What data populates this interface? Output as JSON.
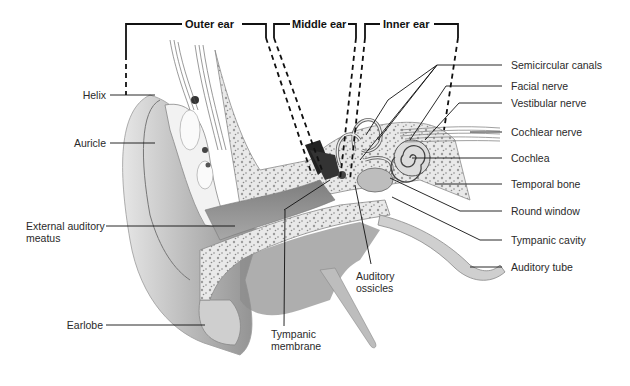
{
  "diagram": {
    "sections": [
      {
        "id": "outer",
        "label": "Outer ear"
      },
      {
        "id": "middle",
        "label": "Middle ear"
      },
      {
        "id": "inner",
        "label": "Inner ear"
      }
    ],
    "labels_left": [
      {
        "id": "helix",
        "text": "Helix"
      },
      {
        "id": "auricle",
        "text": "Auricle"
      },
      {
        "id": "external-auditory-meatus",
        "line1": "External auditory",
        "line2": "meatus"
      },
      {
        "id": "earlobe",
        "text": "Earlobe"
      }
    ],
    "labels_bottom": [
      {
        "id": "tympanic-membrane",
        "line1": "Tympanic",
        "line2": "membrane"
      },
      {
        "id": "auditory-ossicles",
        "line1": "Auditory",
        "line2": "ossicles"
      }
    ],
    "labels_right": [
      {
        "id": "semicircular-canals",
        "text": "Semicircular canals"
      },
      {
        "id": "facial-nerve",
        "text": "Facial nerve"
      },
      {
        "id": "vestibular-nerve",
        "text": "Vestibular nerve"
      },
      {
        "id": "cochlear-nerve",
        "text": "Cochlear nerve"
      },
      {
        "id": "cochlea",
        "text": "Cochlea"
      },
      {
        "id": "temporal-bone",
        "text": "Temporal bone"
      },
      {
        "id": "round-window",
        "text": "Round window"
      },
      {
        "id": "tympanic-cavity",
        "text": "Tympanic cavity"
      },
      {
        "id": "auditory-tube",
        "text": "Auditory tube"
      }
    ]
  }
}
